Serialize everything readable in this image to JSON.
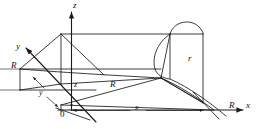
{
  "figure": {
    "kind": "3d-coordinate-geometry-diagram",
    "stroke_color": "#1a1a1a",
    "background_color": "#ffffff",
    "axes": [
      {
        "id": "z",
        "label": "z",
        "direction": "up",
        "x": 73,
        "y": 2
      },
      {
        "id": "y",
        "label": "y",
        "direction": "upper-left",
        "x": 16,
        "y": 45
      },
      {
        "id": "x",
        "label": "x",
        "direction": "right",
        "x": 246,
        "y": 104
      }
    ],
    "labels": [
      {
        "id": "radius-y-axis",
        "text": "R",
        "x": 12,
        "y": 65,
        "style": "cap"
      },
      {
        "id": "radius-mid",
        "text": "R",
        "x": 110,
        "y": 84,
        "style": "cap"
      },
      {
        "id": "radius-x-axis",
        "text": "R",
        "x": 228,
        "y": 104,
        "style": "cap"
      },
      {
        "id": "cylinder-radius",
        "text": "r",
        "x": 188,
        "y": 58,
        "style": "cap"
      },
      {
        "id": "dim-z",
        "text": "z",
        "x": 74,
        "y": 84,
        "style": "dim"
      },
      {
        "id": "dim-y",
        "text": "y",
        "x": 39,
        "y": 93,
        "style": "dim"
      },
      {
        "id": "dim-x",
        "text": "x",
        "x": 138,
        "y": 107,
        "style": "dim"
      },
      {
        "id": "origin",
        "text": "0",
        "x": 61,
        "y": 110,
        "style": "origin"
      }
    ]
  }
}
